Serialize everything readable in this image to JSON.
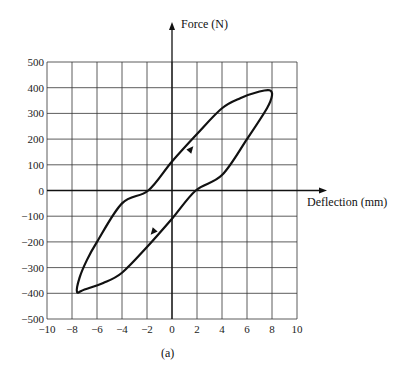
{
  "chart_data": {
    "type": "line",
    "title": "",
    "caption": "(a)",
    "xlabel": "Deflection (mm)",
    "ylabel": "Force (N)",
    "xlim": [
      -10,
      10
    ],
    "ylim": [
      -500,
      500
    ],
    "grid": true,
    "xticks": [
      -10,
      -8,
      -6,
      -4,
      -2,
      0,
      2,
      4,
      6,
      8,
      10
    ],
    "yticks": [
      500,
      400,
      300,
      200,
      100,
      0,
      -100,
      -200,
      -300,
      -400,
      -500
    ],
    "series": [
      {
        "name": "hysteresis loop",
        "description": "Closed force-deflection hysteresis loop, counter-clockwise: loading along upper-left branch, unloading along lower-right branch",
        "points": [
          [
            -7.6,
            -395
          ],
          [
            -7.4,
            -340
          ],
          [
            -6.8,
            -270
          ],
          [
            -6.0,
            -200
          ],
          [
            -4.0,
            -50
          ],
          [
            -1.9,
            0
          ],
          [
            0,
            113
          ],
          [
            2,
            220
          ],
          [
            4,
            320
          ],
          [
            5.5,
            360
          ],
          [
            7.0,
            385
          ],
          [
            7.8,
            390
          ],
          [
            8.0,
            370
          ],
          [
            7.6,
            320
          ],
          [
            6.0,
            200
          ],
          [
            4.0,
            60
          ],
          [
            1.9,
            0
          ],
          [
            0,
            -110
          ],
          [
            -2,
            -220
          ],
          [
            -4,
            -320
          ],
          [
            -5.5,
            -360
          ],
          [
            -7.0,
            -385
          ],
          [
            -7.6,
            -395
          ]
        ]
      }
    ],
    "annotations": [
      {
        "type": "arrow",
        "at": [
          1.5,
          160
        ],
        "direction": "up-right"
      },
      {
        "type": "arrow",
        "at": [
          -1.5,
          -160
        ],
        "direction": "down-left"
      }
    ]
  }
}
